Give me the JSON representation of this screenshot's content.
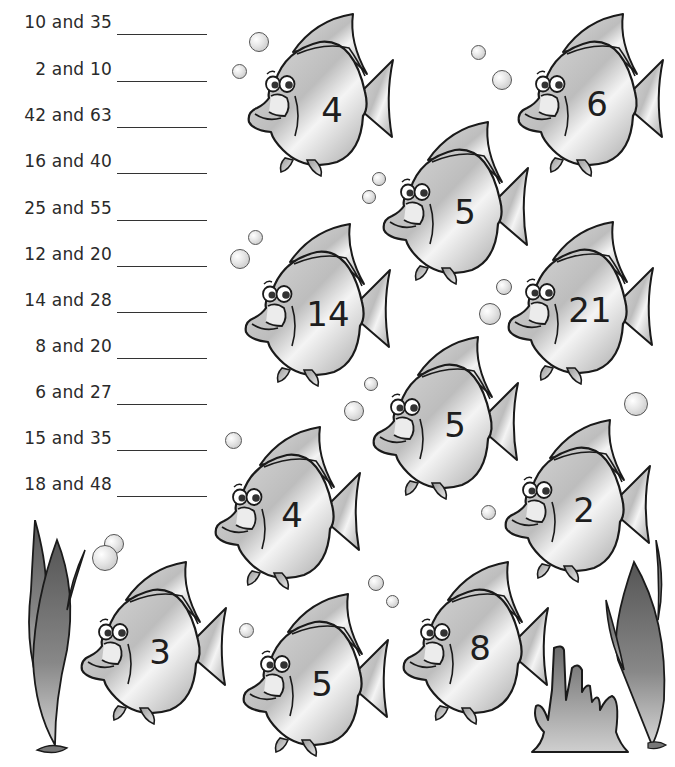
{
  "worksheet": {
    "problems": [
      {
        "a": "10",
        "b": "35",
        "text": "10 and 35",
        "answer": ""
      },
      {
        "a": "2",
        "b": "10",
        "text": "2 and 10",
        "answer": ""
      },
      {
        "a": "42",
        "b": "63",
        "text": "42 and 63",
        "answer": ""
      },
      {
        "a": "16",
        "b": "40",
        "text": "16 and 40",
        "answer": ""
      },
      {
        "a": "25",
        "b": "55",
        "text": "25 and 55",
        "answer": ""
      },
      {
        "a": "12",
        "b": "20",
        "text": "12 and 20",
        "answer": ""
      },
      {
        "a": "14",
        "b": "28",
        "text": "14 and 28",
        "answer": ""
      },
      {
        "a": "8",
        "b": "20",
        "text": "8 and 20",
        "answer": ""
      },
      {
        "a": "6",
        "b": "27",
        "text": "6 and 27",
        "answer": ""
      },
      {
        "a": "15",
        "b": "35",
        "text": "15 and 35",
        "answer": ""
      },
      {
        "a": "18",
        "b": "48",
        "text": "18 and 48",
        "answer": ""
      }
    ],
    "fish": [
      {
        "number": "4",
        "x": 245,
        "y": 12
      },
      {
        "number": "6",
        "x": 515,
        "y": 12
      },
      {
        "number": "5",
        "x": 380,
        "y": 120
      },
      {
        "number": "14",
        "x": 242,
        "y": 222
      },
      {
        "number": "21",
        "x": 505,
        "y": 220
      },
      {
        "number": "5",
        "x": 370,
        "y": 335
      },
      {
        "number": "4",
        "x": 212,
        "y": 425
      },
      {
        "number": "2",
        "x": 502,
        "y": 418
      },
      {
        "number": "3",
        "x": 78,
        "y": 560
      },
      {
        "number": "5",
        "x": 240,
        "y": 592
      },
      {
        "number": "8",
        "x": 400,
        "y": 560
      }
    ],
    "colors": {
      "fish_fill_light": "#f2f2f2",
      "fish_fill_dark": "#a8a8a8",
      "outline": "#1a1a1a",
      "seaweed": "#7a7a7a",
      "coral": "#6e6e6e"
    }
  }
}
